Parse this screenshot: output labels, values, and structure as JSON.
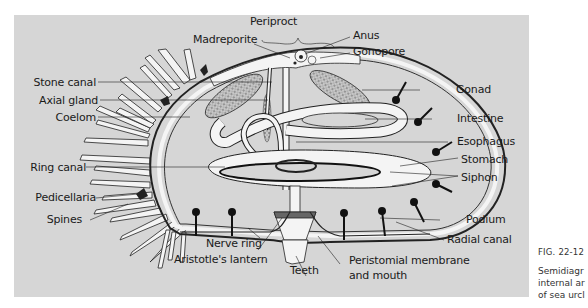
{
  "figure": {
    "number": "FIG. 22-12",
    "caption_lines": [
      "Semidiagr",
      "internal ar",
      "of sea urcl"
    ]
  },
  "labels": {
    "periproct": "Periproct",
    "madreporite": "Madreporite",
    "anus": "Anus",
    "gonopore": "Gonopore",
    "stone_canal": "Stone canal",
    "axial_gland": "Axial gland",
    "coelom": "Coelom",
    "gonad": "Gonad",
    "intestine": "Intestine",
    "esophagus": "Esophagus",
    "stomach": "Stomach",
    "siphon": "Siphon",
    "ring_canal": "Ring canal",
    "pedicellaria": "Pedicellaria",
    "spines": "Spines",
    "podium": "Podium",
    "radial_canal": "Radial canal",
    "nerve_ring": "Nerve ring",
    "aristotles_lantern": "Aristotle's lantern",
    "teeth": "Teeth",
    "peristomial_line1": "Peristomial membrane",
    "peristomial_line2": "and mouth"
  },
  "colors": {
    "panel_bg": "#d6d6d6",
    "ink": "#1a1a1a",
    "organ_fill": "#f4f4f4",
    "gonad_fill": "#a9a9a9"
  }
}
